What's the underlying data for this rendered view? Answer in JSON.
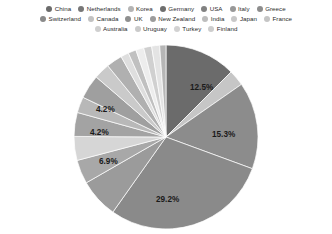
{
  "legend": {
    "rows": [
      [
        {
          "label": "China",
          "color": "#6b6b6b"
        },
        {
          "label": "Netherlands",
          "color": "#777777"
        },
        {
          "label": "Korea",
          "color": "#b4b4b4"
        },
        {
          "label": "Germany",
          "color": "#6e6e6e"
        },
        {
          "label": "USA",
          "color": "#818181"
        },
        {
          "label": "Italy",
          "color": "#989898"
        },
        {
          "label": "Greece",
          "color": "#8d8d8d"
        }
      ],
      [
        {
          "label": "Switzerland",
          "color": "#8a8a8a"
        },
        {
          "label": "Canada",
          "color": "#c2c2c2"
        },
        {
          "label": "UK",
          "color": "#8f8f8f"
        },
        {
          "label": "New Zealand",
          "color": "#9c9c9c"
        },
        {
          "label": "India",
          "color": "#bdbdbd"
        },
        {
          "label": "Japan",
          "color": "#c8c8c8"
        },
        {
          "label": "France",
          "color": "#c5c5c5"
        }
      ],
      [
        {
          "label": "Australia",
          "color": "#cfcfcf"
        },
        {
          "label": "Uruguay",
          "color": "#cacaca"
        },
        {
          "label": "Turkey",
          "color": "#d2d2d2"
        },
        {
          "label": "Finland",
          "color": "#cdcdcd"
        }
      ]
    ]
  },
  "chart_data": {
    "type": "pie",
    "title": "",
    "legend_position": "top",
    "grid": false,
    "categories": [
      "China",
      "Netherlands",
      "Korea",
      "Germany",
      "USA",
      "Italy",
      "Greece",
      "Switzerland",
      "Canada",
      "UK",
      "New Zealand",
      "India",
      "Japan",
      "France",
      "Australia",
      "Uruguay",
      "Turkey",
      "Finland"
    ],
    "values": [
      12.5,
      2.8,
      15.3,
      29.2,
      6.9,
      4.2,
      4.2,
      4.2,
      2.8,
      4.2,
      2.8,
      2.8,
      1.4,
      1.4,
      1.4,
      1.4,
      1.4,
      1.1
    ],
    "labels_shown": [
      "12.5%",
      "15.3%",
      "29.2%",
      "6.9%",
      "4.2%",
      "4.2%"
    ],
    "slices": [
      {
        "name": "China",
        "percent": 12.5,
        "label": "12.5%",
        "color": "#6b6b6b",
        "label_x": 124,
        "label_y": 48
      },
      {
        "name": "Netherlands",
        "percent": 2.8,
        "label": "",
        "color": "#c6c6c6",
        "label_x": 0,
        "label_y": 0
      },
      {
        "name": "Korea",
        "percent": 15.3,
        "label": "15.3%",
        "color": "#8c8c8c",
        "label_x": 146,
        "label_y": 95
      },
      {
        "name": "Germany",
        "percent": 29.2,
        "label": "29.2%",
        "color": "#8a8a8a",
        "label_x": 90,
        "label_y": 160
      },
      {
        "name": "USA",
        "percent": 6.9,
        "label": "6.9%",
        "color": "#9b9b9b",
        "label_x": 33,
        "label_y": 122
      },
      {
        "name": "Italy",
        "percent": 4.2,
        "label": "4.2%",
        "color": "#a8a8a8",
        "label_x": 24,
        "label_y": 93
      },
      {
        "name": "Greece",
        "percent": 4.2,
        "label": "",
        "color": "#d6d6d6",
        "label_x": 0,
        "label_y": 0
      },
      {
        "name": "Switzerland",
        "percent": 4.2,
        "label": "4.2%",
        "color": "#a3a3a3",
        "label_x": 30,
        "label_y": 70
      },
      {
        "name": "Canada",
        "percent": 2.8,
        "label": "",
        "color": "#b8b8b8",
        "label_x": 0,
        "label_y": 0
      },
      {
        "name": "UK",
        "percent": 4.2,
        "label": "",
        "color": "#9f9f9f",
        "label_x": 0,
        "label_y": 0
      },
      {
        "name": "New Zealand",
        "percent": 2.8,
        "label": "",
        "color": "#cacaca",
        "label_x": 0,
        "label_y": 0
      },
      {
        "name": "India",
        "percent": 2.8,
        "label": "",
        "color": "#b0b0b0",
        "label_x": 0,
        "label_y": 0
      },
      {
        "name": "Japan",
        "percent": 1.4,
        "label": "",
        "color": "#dedede",
        "label_x": 0,
        "label_y": 0
      },
      {
        "name": "France",
        "percent": 1.4,
        "label": "",
        "color": "#c0c0c0",
        "label_x": 0,
        "label_y": 0
      },
      {
        "name": "Australia",
        "percent": 1.4,
        "label": "",
        "color": "#ededed",
        "label_x": 0,
        "label_y": 0
      },
      {
        "name": "Uruguay",
        "percent": 1.4,
        "label": "",
        "color": "#d0d0d0",
        "label_x": 0,
        "label_y": 0
      },
      {
        "name": "Turkey",
        "percent": 1.4,
        "label": "",
        "color": "#e4e4e4",
        "label_x": 0,
        "label_y": 0
      },
      {
        "name": "Finland",
        "percent": 1.1,
        "label": "",
        "color": "#b6b6b6",
        "label_x": 0,
        "label_y": 0
      }
    ]
  }
}
